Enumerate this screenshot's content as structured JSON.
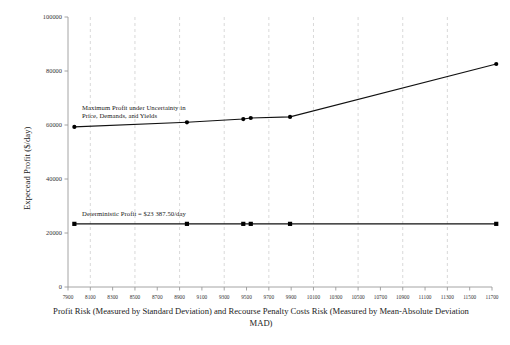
{
  "chart_data": {
    "type": "line",
    "title": "",
    "xlabel": "Profit Risk (Measured by Standard Deviation) and Recourse Penalty Costs Risk (Measured by Mean-Absolute Deviation MAD)",
    "xlabel_line1": "Profit Risk (Measured by Standard Deviation) and Recourse Penalty Costs Risk (Measured by Mean-Absolute Deviation",
    "xlabel_line2": "MAD)",
    "ylabel": "Expecead Profit ($/day)",
    "xlim": [
      7900,
      11700
    ],
    "ylim": [
      0,
      100000
    ],
    "xticks": [
      7900,
      8100,
      8300,
      8500,
      8700,
      8900,
      9100,
      9300,
      9500,
      9700,
      9900,
      10100,
      10300,
      10500,
      10700,
      10900,
      11100,
      11300,
      11500,
      11700
    ],
    "yticks": [
      0,
      20000,
      40000,
      60000,
      80000,
      100000
    ],
    "grid": "vertical-dashed",
    "gridlines_x": [
      8100,
      8500,
      8900,
      9300,
      9700,
      10100,
      10500,
      10900,
      11300
    ],
    "legend": "none",
    "series": [
      {
        "name": "Maximum Profit under Uncertainty in Price, Demands, and Yields",
        "marker": "filled-circle",
        "x": [
          7957,
          8966,
          9471,
          9538,
          9890,
          11738
        ],
        "values": [
          59300,
          61000,
          62200,
          62600,
          63000,
          82600
        ]
      },
      {
        "name": "Deterministic Profit = $23 387.50/day",
        "marker": "filled-square",
        "x": [
          7957,
          8966,
          9471,
          9538,
          9890,
          11738
        ],
        "values": [
          23387.5,
          23387.5,
          23387.5,
          23387.5,
          23387.5,
          23387.5
        ]
      }
    ],
    "annotations": [
      {
        "id": "upper",
        "line1": "Maximum Profit under Uncertainty in",
        "line2": "Price, Demands, and Yields"
      },
      {
        "id": "lower",
        "line1": "Deterministic Profit = $23 387.50/day"
      }
    ]
  },
  "axis": {
    "y_tick_labels": [
      "100000",
      "80000",
      "60000",
      "40000",
      "20000",
      "0"
    ],
    "x_tick_labels": [
      "7900",
      "8100",
      "8300",
      "8500",
      "8700",
      "8900",
      "9100",
      "9300",
      "9500",
      "9700",
      "9900",
      "10100",
      "10300",
      "10500",
      "10700",
      "10900",
      "11100",
      "11300",
      "11500",
      "11700"
    ]
  },
  "colors": {
    "line": "#111111",
    "marker": "#000000",
    "axis": "#9a9a9a",
    "grid": "#c9c9c9",
    "text": "#222222",
    "background": "#ffffff"
  }
}
